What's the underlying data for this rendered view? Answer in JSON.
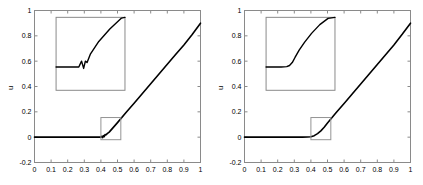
{
  "figure": {
    "background_color": "#ffffff",
    "line_color": "#000000",
    "frame_color": "#808080",
    "box_color": "#808080"
  },
  "chart_data": [
    {
      "type": "line",
      "panel": "left",
      "title": "",
      "subtitle": "",
      "xlabel": "",
      "ylabel": "u",
      "xlim": [
        0,
        1
      ],
      "ylim": [
        -0.2,
        1
      ],
      "grid": false,
      "legend": null,
      "xticks": [
        0,
        0.1,
        0.2,
        0.3,
        0.4,
        0.5,
        0.6,
        0.7,
        0.8,
        0.9,
        1
      ],
      "xticklabels": [
        "0",
        "0.1",
        "0.2",
        "0.3",
        "0.4",
        "0.5",
        "0.6",
        "0.7",
        "0.8",
        "0.9",
        "1"
      ],
      "yticks": [
        -0.2,
        0,
        0.2,
        0.4,
        0.6,
        0.8,
        1
      ],
      "yticklabels": [
        "-0.2",
        "0",
        "0.2",
        "0.4",
        "0.6",
        "0.8",
        "1"
      ],
      "series": [
        {
          "name": "u(x) non-smooth solution",
          "x": [
            0.0,
            0.05,
            0.1,
            0.15,
            0.2,
            0.25,
            0.3,
            0.35,
            0.38,
            0.4,
            0.405,
            0.41,
            0.415,
            0.42,
            0.425,
            0.43,
            0.44,
            0.45,
            0.5,
            0.55,
            0.6,
            0.65,
            0.7,
            0.75,
            0.8,
            0.85,
            0.9,
            0.95,
            1.0
          ],
          "y": [
            0.0,
            0.0,
            0.0,
            0.0,
            0.0,
            0.0,
            0.0,
            0.0,
            0.0,
            0.0,
            0.006,
            -0.004,
            0.012,
            0.004,
            0.02,
            0.018,
            0.03,
            0.04,
            0.115,
            0.192,
            0.268,
            0.345,
            0.422,
            0.498,
            0.575,
            0.652,
            0.728,
            0.81,
            0.9
          ]
        }
      ],
      "annotation_box": {
        "name": "zoom-region-box",
        "x0": 0.4,
        "x1": 0.52,
        "y0": -0.02,
        "y1": 0.155
      },
      "inset": {
        "name": "inset-axes",
        "x0_frac": 0.13,
        "x1_frac": 0.545,
        "y0_frac": 0.475,
        "y1_frac": 0.955,
        "curve_x": [
          0.0,
          0.2,
          0.33,
          0.37,
          0.4,
          0.425,
          0.45,
          0.5,
          0.62,
          0.78,
          0.95,
          1.0
        ],
        "curve_y": [
          0.32,
          0.32,
          0.32,
          0.4,
          0.3,
          0.4,
          0.38,
          0.5,
          0.67,
          0.84,
          0.99,
          1.0
        ],
        "has_oscillation": true
      }
    },
    {
      "type": "line",
      "panel": "right",
      "title": "",
      "subtitle": "",
      "xlabel": "",
      "ylabel": "u",
      "xlim": [
        0,
        1
      ],
      "ylim": [
        -0.2,
        1
      ],
      "grid": false,
      "legend": null,
      "xticks": [
        0,
        0.1,
        0.2,
        0.3,
        0.4,
        0.5,
        0.6,
        0.7,
        0.8,
        0.9,
        1
      ],
      "xticklabels": [
        "0",
        "0.1",
        "0.2",
        "0.3",
        "0.4",
        "0.5",
        "0.6",
        "0.7",
        "0.8",
        "0.9",
        "1"
      ],
      "yticks": [
        -0.2,
        0,
        0.2,
        0.4,
        0.6,
        0.8,
        1
      ],
      "yticklabels": [
        "-0.2",
        "0",
        "0.2",
        "0.4",
        "0.6",
        "0.8",
        "1"
      ],
      "series": [
        {
          "name": "u(x) smoothed solution",
          "x": [
            0.0,
            0.05,
            0.1,
            0.15,
            0.2,
            0.25,
            0.3,
            0.35,
            0.38,
            0.4,
            0.42,
            0.44,
            0.46,
            0.48,
            0.5,
            0.55,
            0.6,
            0.65,
            0.7,
            0.75,
            0.8,
            0.85,
            0.9,
            0.95,
            1.0
          ],
          "y": [
            0.0,
            0.0,
            0.0,
            0.0,
            0.0,
            0.0,
            0.0,
            0.0,
            0.001,
            0.003,
            0.012,
            0.028,
            0.05,
            0.078,
            0.112,
            0.19,
            0.266,
            0.343,
            0.42,
            0.497,
            0.574,
            0.651,
            0.728,
            0.812,
            0.9
          ]
        }
      ],
      "annotation_box": {
        "name": "zoom-region-box",
        "x0": 0.4,
        "x1": 0.52,
        "y0": -0.02,
        "y1": 0.155
      },
      "inset": {
        "name": "inset-axes",
        "x0_frac": 0.13,
        "x1_frac": 0.545,
        "y0_frac": 0.475,
        "y1_frac": 0.955,
        "curve_x": [
          0.0,
          0.12,
          0.22,
          0.3,
          0.34,
          0.38,
          0.42,
          0.48,
          0.56,
          0.66,
          0.78,
          0.9,
          1.0
        ],
        "curve_y": [
          0.32,
          0.32,
          0.32,
          0.325,
          0.34,
          0.38,
          0.45,
          0.55,
          0.66,
          0.78,
          0.9,
          0.985,
          1.0
        ],
        "has_oscillation": false
      }
    }
  ]
}
